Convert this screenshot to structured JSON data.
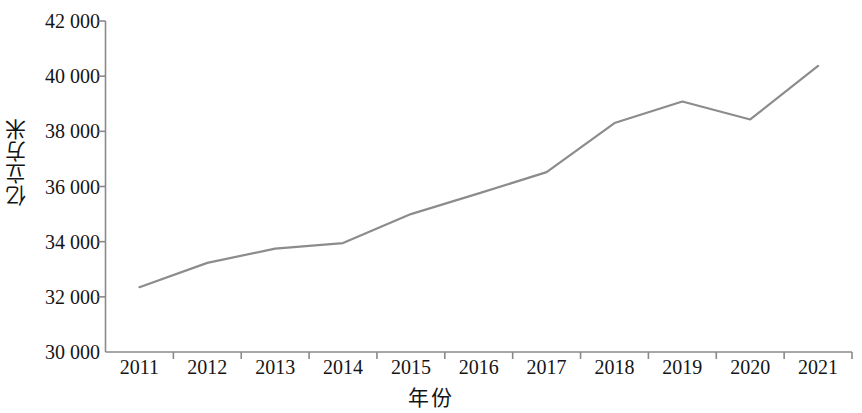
{
  "chart_data": {
    "type": "line",
    "title": "",
    "xlabel": "年份",
    "ylabel": "亿立方米",
    "categories": [
      "2011",
      "2012",
      "2013",
      "2014",
      "2015",
      "2016",
      "2017",
      "2018",
      "2019",
      "2020",
      "2021"
    ],
    "values": [
      32350,
      33230,
      33750,
      33950,
      35000,
      35750,
      36520,
      38300,
      39080,
      38430,
      40370
    ],
    "series": [
      {
        "name": "亿立方米",
        "values": [
          32350,
          33230,
          33750,
          33950,
          35000,
          35750,
          36520,
          38300,
          39080,
          38430,
          40370
        ]
      }
    ],
    "ylim": [
      30000,
      42000
    ],
    "ytick_values": [
      30000,
      32000,
      34000,
      36000,
      38000,
      40000,
      42000
    ],
    "ytick_labels": [
      "30 000",
      "32 000",
      "34 000",
      "36 000",
      "38 000",
      "40 000",
      "42 000"
    ],
    "xtick_labels": [
      "2011",
      "2012",
      "2013",
      "2014",
      "2015",
      "2016",
      "2017",
      "2018",
      "2019",
      "2020",
      "2021"
    ],
    "grid": false,
    "legend": false,
    "line_color": "#8c8c8c",
    "axis_color": "#8a8a8a"
  }
}
